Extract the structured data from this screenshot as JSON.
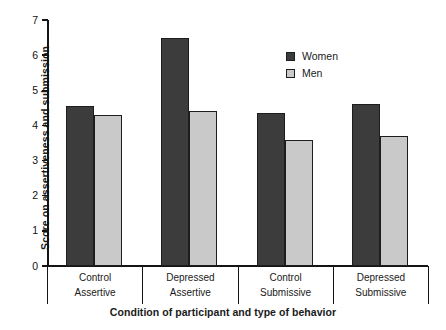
{
  "chart_data": {
    "type": "bar",
    "title": "",
    "xlabel": "Condition of participant and type of behavior",
    "ylabel": "Score on assertiveness and submission",
    "ylim": [
      0,
      7
    ],
    "yticks": [
      0,
      1,
      2,
      3,
      4,
      5,
      6,
      7
    ],
    "grid": false,
    "legend_position": "top-right",
    "categories": [
      "Control Assertive",
      "Depressed Assertive",
      "Control Submissive",
      "Depressed Submissive"
    ],
    "category_lines": [
      {
        "line1": "Control",
        "line2": "Assertive"
      },
      {
        "line1": "Depressed",
        "line2": "Assertive"
      },
      {
        "line1": "Control",
        "line2": "Submissive"
      },
      {
        "line1": "Depressed",
        "line2": "Submissive"
      }
    ],
    "series": [
      {
        "name": "Women",
        "color": "#3c3c3c",
        "values": [
          4.55,
          6.5,
          4.35,
          4.6
        ]
      },
      {
        "name": "Men",
        "color": "#c9c9c9",
        "values": [
          4.3,
          4.4,
          3.6,
          3.7
        ]
      }
    ]
  },
  "legend": {
    "items": [
      {
        "label": "Women",
        "color": "#3c3c3c"
      },
      {
        "label": "Men",
        "color": "#c9c9c9"
      }
    ]
  },
  "axis": {
    "y_tick_labels": [
      "7",
      "6",
      "5",
      "4",
      "3",
      "2",
      "1",
      "0"
    ]
  }
}
